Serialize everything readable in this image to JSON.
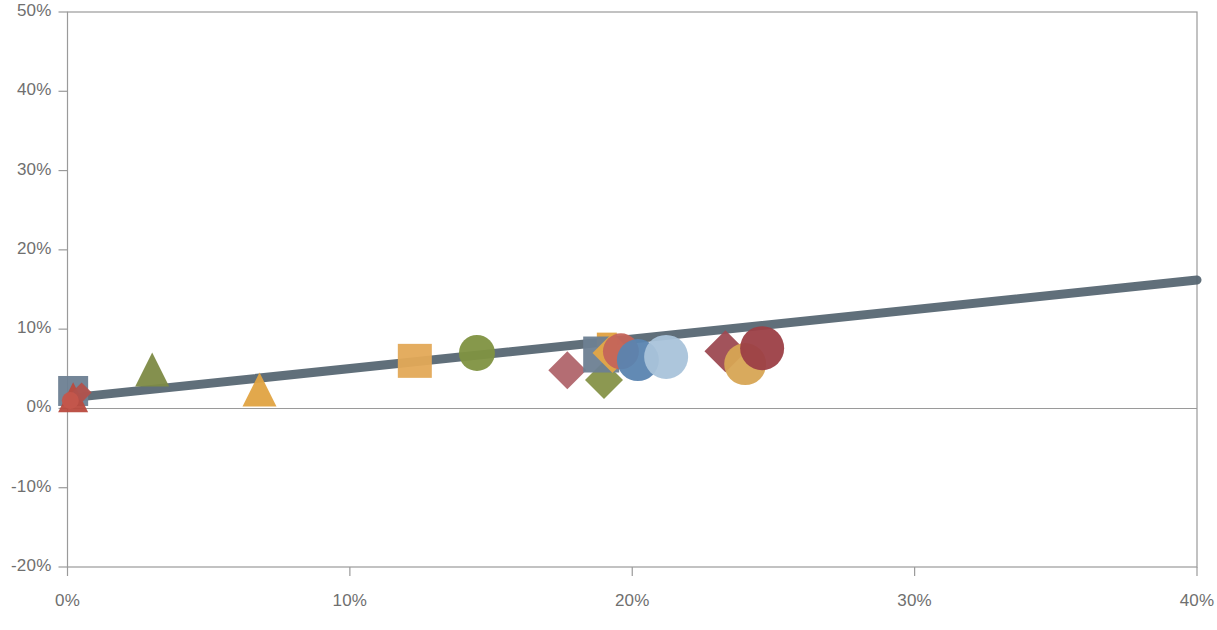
{
  "chart_data": {
    "type": "scatter",
    "title": "",
    "subtitle": "",
    "xlabel": "",
    "ylabel": "",
    "xlim": [
      0,
      40
    ],
    "ylim": [
      -20,
      50
    ],
    "x_unit": "%",
    "y_unit": "%",
    "grid": false,
    "legend": "none",
    "zero_line": 0,
    "x_ticks": [
      0,
      10,
      20,
      30,
      40
    ],
    "x_tick_labels": [
      "0%",
      "10%",
      "20%",
      "30%",
      "40%"
    ],
    "y_ticks": [
      -20,
      -10,
      0,
      10,
      20,
      30,
      40,
      50
    ],
    "y_tick_labels": [
      "-20%",
      "-10%",
      "0%",
      "10%",
      "20%",
      "30%",
      "40%",
      "50%"
    ],
    "trendline": {
      "name": "linear trend",
      "x0": 0.0,
      "y0": 1.3,
      "x1": 40.0,
      "y1": 16.2,
      "color": "#53636f",
      "width": 9
    },
    "points": [
      {
        "label": "p01",
        "x": 0.2,
        "y": 2.2,
        "marker": "square",
        "color": "#6d7f92",
        "size": 30
      },
      {
        "label": "p02",
        "x": 0.2,
        "y": 1.4,
        "marker": "triangle",
        "color": "#b94a3e",
        "size": 30
      },
      {
        "label": "p03",
        "x": 0.5,
        "y": 2.0,
        "marker": "diamond",
        "color": "#b1514c",
        "size": 20
      },
      {
        "label": "p04",
        "x": 0.1,
        "y": 1.0,
        "marker": "circle",
        "color": "#c4564c",
        "size": 17
      },
      {
        "label": "p05",
        "x": 3.0,
        "y": 4.9,
        "marker": "triangle",
        "color": "#7d8a45",
        "size": 34
      },
      {
        "label": "p06",
        "x": 6.8,
        "y": 2.4,
        "marker": "triangle",
        "color": "#e0a342",
        "size": 34
      },
      {
        "label": "p07",
        "x": 12.3,
        "y": 6.0,
        "marker": "square",
        "color": "#e3a957",
        "size": 34
      },
      {
        "label": "p08",
        "x": 14.5,
        "y": 7.0,
        "marker": "circle",
        "color": "#7f9241",
        "size": 36
      },
      {
        "label": "p09",
        "x": 17.7,
        "y": 4.8,
        "marker": "diamond",
        "color": "#b0656b",
        "size": 38
      },
      {
        "label": "p10",
        "x": 19.0,
        "y": 3.6,
        "marker": "diamond",
        "color": "#869248",
        "size": 38
      },
      {
        "label": "p11",
        "x": 19.1,
        "y": 8.3,
        "marker": "square",
        "color": "#e0a03f",
        "size": 20
      },
      {
        "label": "p12",
        "x": 18.9,
        "y": 6.8,
        "marker": "square",
        "color": "#6d7f92",
        "size": 36
      },
      {
        "label": "p13",
        "x": 19.3,
        "y": 7.0,
        "marker": "diamond",
        "color": "#e4a646",
        "size": 40
      },
      {
        "label": "p14",
        "x": 19.6,
        "y": 7.2,
        "marker": "circle",
        "color": "#c4645a",
        "size": 36
      },
      {
        "label": "p15",
        "x": 20.2,
        "y": 6.1,
        "marker": "circle",
        "color": "#5a84b0",
        "size": 42
      },
      {
        "label": "p16",
        "x": 21.2,
        "y": 6.5,
        "marker": "circle",
        "color": "#a9c3da",
        "size": 44
      },
      {
        "label": "p17",
        "x": 23.3,
        "y": 7.2,
        "marker": "diamond",
        "color": "#9d4a52",
        "size": 42
      },
      {
        "label": "p18",
        "x": 24.0,
        "y": 5.6,
        "marker": "circle",
        "color": "#d7a554",
        "size": 42
      },
      {
        "label": "p19",
        "x": 24.6,
        "y": 7.6,
        "marker": "circle",
        "color": "#9c3f46",
        "size": 44
      }
    ]
  },
  "axes": {
    "frame_color": "#9a9a9a",
    "tick_color": "#9a9a9a",
    "zero_line_color": "#9a9a9a",
    "label_color": "#6f6f6f"
  }
}
